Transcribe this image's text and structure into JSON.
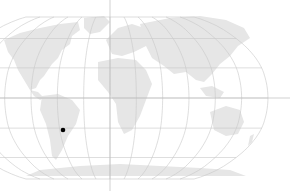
{
  "map": {
    "projection": "Robinson",
    "width": 290,
    "height": 191,
    "center_x": 110,
    "equator_y": 98,
    "half_width": 158,
    "half_height": 81,
    "central_meridian_extends_full_height": true,
    "equator_extends_to_right_edge": true,
    "graticule_step_deg": 30,
    "colors": {
      "background": "#ffffff",
      "land": "#e6e6e6",
      "graticule": "#c8c8c8",
      "marker": "#000000"
    },
    "marker": {
      "label": "location-marker",
      "x": 63,
      "y": 130,
      "radius": 2.3
    }
  }
}
